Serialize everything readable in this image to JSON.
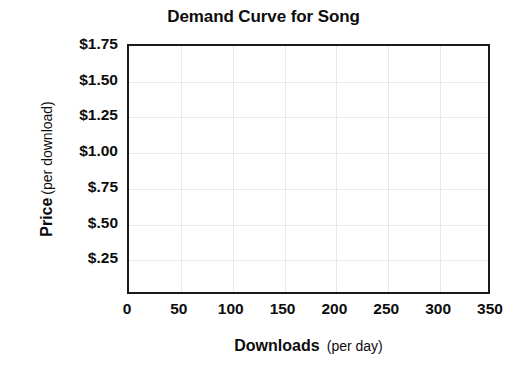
{
  "chart_data": {
    "type": "line",
    "title": "Demand Curve for Song",
    "xlabel_strong": "Downloads",
    "xlabel_paren": "(per day)",
    "ylabel_strong": "Price",
    "ylabel_paren": "(per download)",
    "x_tick_labels": [
      "0",
      "50",
      "100",
      "150",
      "200",
      "250",
      "300",
      "350"
    ],
    "x_tick_values": [
      0,
      50,
      100,
      150,
      200,
      250,
      300,
      350
    ],
    "y_tick_labels": [
      "$1.75",
      "$1.50",
      "$1.25",
      "$1.00",
      "$.75",
      "$.50",
      "$.25"
    ],
    "y_tick_values": [
      1.75,
      1.5,
      1.25,
      1.0,
      0.75,
      0.5,
      0.25
    ],
    "xlim": [
      0,
      350
    ],
    "ylim": [
      0,
      1.75
    ],
    "grid": true,
    "legend": null,
    "series": [],
    "annotations": [],
    "axis_color": "#1a1a1a",
    "grid_color": "#e8e8e8",
    "text_color": "#0d0d0d",
    "background_color": "#ffffff"
  }
}
